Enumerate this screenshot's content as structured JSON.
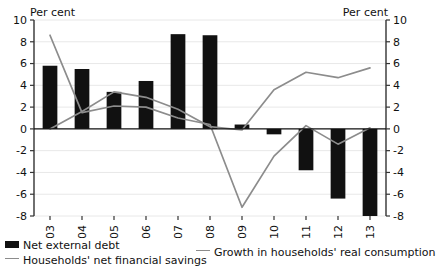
{
  "chart_data": {
    "type": "bar",
    "title": "",
    "subtitle": "",
    "xlabel": "",
    "ylabel": "Per cent",
    "ylabel_right": "Per cent",
    "ylim": [
      -8,
      10
    ],
    "ytick_step": 2,
    "yticks": [
      "10",
      "8",
      "6",
      "4",
      "2",
      "0",
      "-2",
      "-4",
      "-6",
      "-8"
    ],
    "ytick_values": [
      10,
      8,
      6,
      4,
      2,
      0,
      -2,
      -4,
      -6,
      -8
    ],
    "grid": true,
    "legend_position": "bottom",
    "categories": [
      "2003",
      "2004",
      "2005",
      "2006",
      "2007",
      "2008",
      "2009",
      "2010",
      "2011",
      "2012",
      "2013"
    ],
    "series": [
      {
        "name": "Net external debt",
        "type": "bar",
        "color": "#111111",
        "values": [
          5.8,
          5.5,
          3.4,
          4.4,
          8.7,
          8.6,
          0.4,
          -0.5,
          -3.8,
          -6.4,
          -8.0
        ]
      },
      {
        "name": "Households' net financial savings",
        "type": "line",
        "color": "#8c8c8c",
        "values": [
          0.0,
          1.6,
          3.4,
          2.9,
          1.8,
          0.2,
          -0.1,
          3.6,
          5.2,
          4.7,
          5.6
        ]
      },
      {
        "name": "Growth in households' real consumption",
        "type": "line",
        "color": "#8c8c8c",
        "values": [
          8.6,
          1.5,
          2.1,
          2.0,
          1.0,
          0.4,
          -7.2,
          -2.5,
          0.3,
          -1.4,
          0.1
        ]
      }
    ]
  },
  "axis": {
    "left_title": "Per cent",
    "right_title": "Per cent"
  },
  "legend": {
    "items": [
      {
        "label": "Net external debt",
        "marker": "bar-swatch",
        "color": "#111111"
      },
      {
        "label": "Households' net financial savings",
        "marker": "line-swatch",
        "color": "#8c8c8c"
      },
      {
        "label": "Growth in households' real consumption",
        "marker": "line-swatch",
        "color": "#8c8c8c"
      }
    ]
  }
}
